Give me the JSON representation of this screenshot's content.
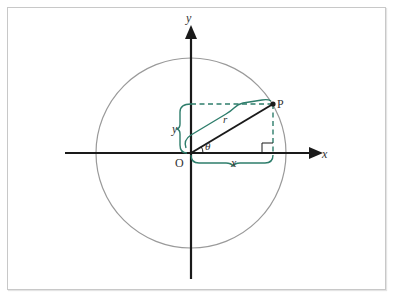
{
  "diagram": {
    "labels": {
      "y_axis": "y",
      "x_axis": "x",
      "origin": "O",
      "point": "P",
      "radius": "r",
      "angle": "θ",
      "x_brace": "x",
      "y_brace": "y"
    },
    "colors": {
      "axis": "#1a1a1a",
      "circle": "#9a9a9a",
      "brace": "#2e7d6b",
      "dashed": "#2e7d6b",
      "frame": "#c8c8c8"
    },
    "geometry": {
      "origin": [
        191,
        153
      ],
      "radius": 95,
      "point": [
        273,
        104
      ]
    }
  }
}
